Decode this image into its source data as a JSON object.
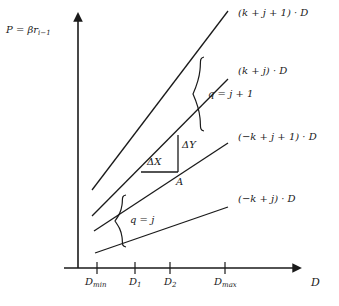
{
  "figure": {
    "axes": {
      "y_label": "P = βr",
      "y_label_sub": "i−1",
      "x_label": "D"
    },
    "x_ticks": [
      {
        "id": "dmin",
        "base": "D",
        "sub": "min",
        "x": 97
      },
      {
        "id": "d1",
        "base": "D",
        "sub": "1",
        "x": 135
      },
      {
        "id": "d2",
        "base": "D",
        "sub": "2",
        "x": 170
      },
      {
        "id": "dmax",
        "base": "D",
        "sub": "max",
        "x": 225
      }
    ],
    "lines": [
      {
        "id": "line-k-j-1",
        "label": "(k + j + 1) · D",
        "x1": 92,
        "y1": 190,
        "x2": 228,
        "y2": 11,
        "label_x": 238,
        "label_y": 14
      },
      {
        "id": "line-k-j",
        "label": "(k + j) · D",
        "x1": 92,
        "y1": 216,
        "x2": 228,
        "y2": 79,
        "label_x": 238,
        "label_y": 72
      },
      {
        "id": "line-mk-j-1",
        "label": "(−k + j + 1) · D",
        "x1": 94,
        "y1": 231,
        "x2": 228,
        "y2": 143,
        "label_x": 238,
        "label_y": 138
      },
      {
        "id": "line-mk-j",
        "label": "(−k + j) · D",
        "x1": 95,
        "y1": 253,
        "x2": 228,
        "y2": 207,
        "label_x": 238,
        "label_y": 200
      }
    ],
    "annotations": {
      "delta_x": "ΔX",
      "delta_y": "ΔY",
      "point_a": "A",
      "brace_upper": "q = j + 1",
      "brace_lower": "q = j"
    },
    "colors": {
      "ink": "#1a1a1a",
      "background": "#ffffff"
    }
  }
}
